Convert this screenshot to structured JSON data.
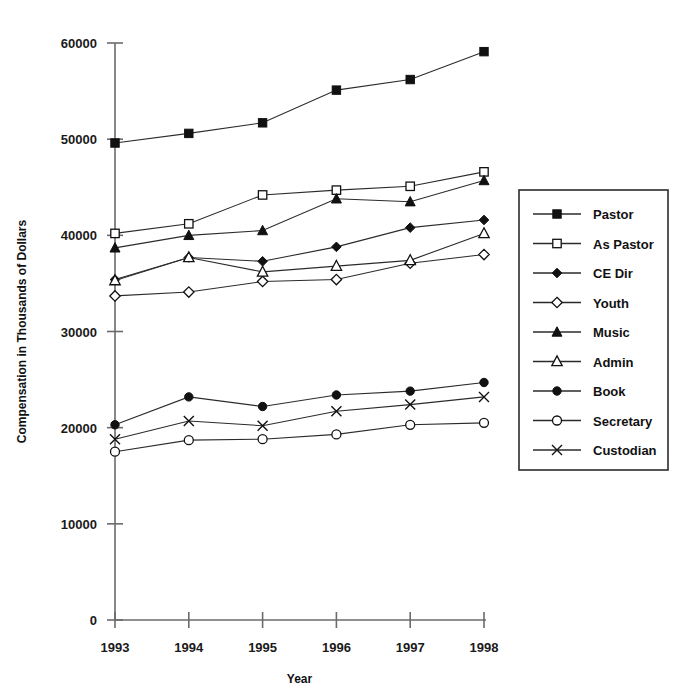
{
  "chart_data": {
    "type": "line",
    "title": "",
    "xlabel": "Year",
    "ylabel": "Compensation in Thousands of Dollars",
    "categories": [
      1993,
      1994,
      1995,
      1996,
      1997,
      1998
    ],
    "xtick_labels": [
      "1993",
      "1994",
      "1995",
      "1996",
      "1997",
      "1998"
    ],
    "ytick_labels": [
      "0",
      "10000",
      "20000",
      "30000",
      "40000",
      "50000",
      "60000"
    ],
    "yticks": [
      0,
      10000,
      20000,
      30000,
      40000,
      50000,
      60000
    ],
    "ylim": [
      0,
      60000
    ],
    "xlim": [
      1993,
      1998
    ],
    "grid": false,
    "legend_position": "right",
    "series": [
      {
        "name": "Pastor",
        "marker": "filled-square",
        "values": [
          49600,
          50600,
          51700,
          55100,
          56200,
          59100
        ]
      },
      {
        "name": "As Pastor",
        "marker": "open-square",
        "values": [
          40200,
          41200,
          44200,
          44700,
          45100,
          46600
        ]
      },
      {
        "name": "CE Dir",
        "marker": "filled-diamond",
        "values": [
          35400,
          37700,
          37300,
          38800,
          40800,
          41600
        ]
      },
      {
        "name": "Youth",
        "marker": "open-diamond",
        "values": [
          33700,
          34100,
          35200,
          35400,
          37100,
          38000
        ]
      },
      {
        "name": "Music",
        "marker": "filled-triangle",
        "values": [
          38700,
          40000,
          40500,
          43800,
          43500,
          45700
        ]
      },
      {
        "name": "Admin",
        "marker": "open-triangle",
        "values": [
          35300,
          37700,
          36200,
          36800,
          37400,
          40200
        ]
      },
      {
        "name": "Book",
        "marker": "filled-circle",
        "values": [
          20300,
          23200,
          22200,
          23400,
          23800,
          24700
        ]
      },
      {
        "name": "Secretary",
        "marker": "open-circle",
        "values": [
          17500,
          18700,
          18800,
          19300,
          20300,
          20500
        ]
      },
      {
        "name": "Custodian",
        "marker": "x-cross",
        "values": [
          18800,
          20700,
          20200,
          21700,
          22400,
          23200
        ]
      }
    ]
  },
  "axis": {
    "x_title": "Year",
    "y_title": "Compensation in Thousands of Dollars"
  },
  "legend": {
    "items": [
      {
        "label": "Pastor",
        "marker": "filled-square"
      },
      {
        "label": "As Pastor",
        "marker": "open-square"
      },
      {
        "label": "CE Dir",
        "marker": "filled-diamond"
      },
      {
        "label": "Youth",
        "marker": "open-diamond"
      },
      {
        "label": "Music",
        "marker": "filled-triangle"
      },
      {
        "label": "Admin",
        "marker": "open-triangle"
      },
      {
        "label": "Book",
        "marker": "filled-circle"
      },
      {
        "label": "Secretary",
        "marker": "open-circle"
      },
      {
        "label": "Custodian",
        "marker": "x-cross"
      }
    ]
  },
  "colors": {
    "ink": "#111111",
    "axis": "#6b6b6b",
    "background": "#ffffff"
  }
}
